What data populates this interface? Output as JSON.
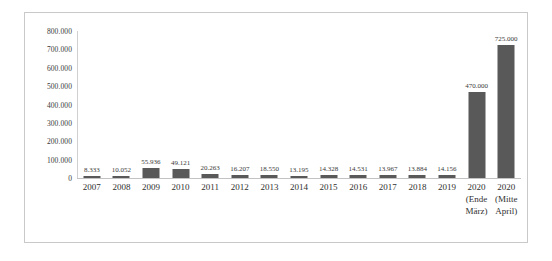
{
  "chart_data": {
    "type": "bar",
    "title": "",
    "subtitle": "",
    "xlabel": "",
    "ylabel": "",
    "ylim": [
      0,
      800000
    ],
    "grid": false,
    "legend": "none",
    "bar_color": "#595959",
    "axis_color": "#c9c9c9",
    "categories": [
      "2007",
      "2008",
      "2009",
      "2010",
      "2011",
      "2012",
      "2013",
      "2014",
      "2015",
      "2016",
      "2017",
      "2018",
      "2019",
      "2020 (Ende März)",
      "2020 (Mitte April)"
    ],
    "category_lines": [
      [
        "2007"
      ],
      [
        "2008"
      ],
      [
        "2009"
      ],
      [
        "2010"
      ],
      [
        "2011"
      ],
      [
        "2012"
      ],
      [
        "2013"
      ],
      [
        "2014"
      ],
      [
        "2015"
      ],
      [
        "2016"
      ],
      [
        "2017"
      ],
      [
        "2018"
      ],
      [
        "2019"
      ],
      [
        "2020",
        "(Ende",
        "März)"
      ],
      [
        "2020",
        "(Mitte",
        "April)"
      ]
    ],
    "values": [
      8333,
      10052,
      55936,
      49121,
      20263,
      16207,
      18550,
      13195,
      14328,
      14531,
      13967,
      13884,
      14156,
      470000,
      725000
    ],
    "data_labels": [
      "8.333",
      "10.052",
      "55.936",
      "49.121",
      "20.263",
      "16.207",
      "18.550",
      "13.195",
      "14.328",
      "14.531",
      "13.967",
      "13.884",
      "14.156",
      "470.000",
      "725.000"
    ],
    "ytick_values": [
      0,
      100000,
      200000,
      300000,
      400000,
      500000,
      600000,
      700000,
      800000
    ],
    "ytick_labels": [
      "0",
      "100.000",
      "200.000",
      "300.000",
      "400.000",
      "500.000",
      "600.000",
      "700.000",
      "800.000"
    ]
  }
}
